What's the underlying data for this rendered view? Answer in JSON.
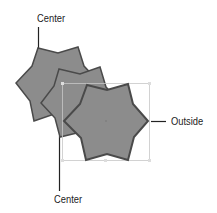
{
  "diagram": {
    "labels": {
      "top_center": "Center",
      "bottom_center": "Center",
      "right_outside": "Outside"
    },
    "colors": {
      "fill": "#8c8c8c",
      "stroke": "#4a4a4a",
      "leader": "#222222",
      "selection_box": "#c8c8c8"
    },
    "shapes": [
      {
        "name": "star-back",
        "stroke_alignment": "Center"
      },
      {
        "name": "star-middle",
        "stroke_alignment": "Center"
      },
      {
        "name": "star-front",
        "stroke_alignment": "Outside"
      }
    ]
  }
}
